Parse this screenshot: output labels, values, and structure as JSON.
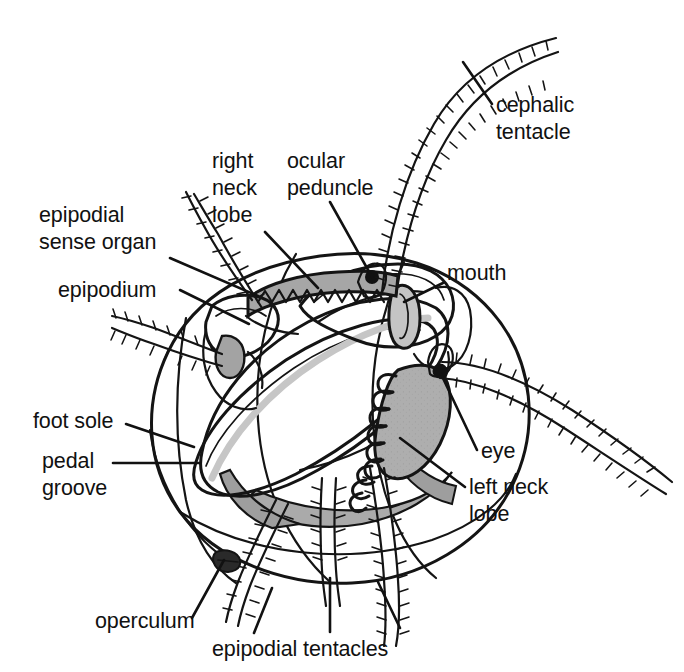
{
  "figure": {
    "view": "right lateral / anterior oblique",
    "background_color": "#ffffff",
    "line_color": "#141414",
    "text_color": "#111111"
  },
  "palette": {
    "shell_fill": "#e3e3e3",
    "body_fill": "#ededed",
    "foot_fill": "#f4f4f4",
    "mantle_shadow": "#bdbdbd",
    "lobe_dark": "#a8a8a8",
    "groove_gray": "#c9c9c9",
    "eye_black": "#111111"
  },
  "labels": [
    {
      "id": "cephalic-tentacle",
      "text_lines": [
        "cephalic",
        "tentacle"
      ],
      "text": "cephalic tentacle",
      "anchor": "start",
      "x": 496,
      "y": 112,
      "line_height": 27,
      "leader": "M 492 104 L 463 62"
    },
    {
      "id": "right-neck-lobe",
      "text_lines": [
        "right",
        "neck",
        "lobe"
      ],
      "text": "right neck lobe",
      "anchor": "start",
      "x": 212,
      "y": 168,
      "line_height": 27,
      "leader": "M 265 232 L 318 288"
    },
    {
      "id": "ocular-peduncle",
      "text_lines": [
        "ocular",
        "peduncle"
      ],
      "text": "ocular peduncle",
      "anchor": "start",
      "x": 287,
      "y": 168,
      "line_height": 27,
      "leader": "M 330 202 L 372 277"
    },
    {
      "id": "epipodial-sense-organ",
      "text_lines": [
        "epipodial",
        "sense organ"
      ],
      "text": "epipodial sense organ",
      "anchor": "start",
      "x": 39,
      "y": 222,
      "line_height": 27,
      "leader": "M 170 258 L 258 296"
    },
    {
      "id": "epipodium",
      "text_lines": [
        "epipodium"
      ],
      "text": "epipodium",
      "anchor": "start",
      "x": 58,
      "y": 297,
      "line_height": 27,
      "leader": "M 180 290 L 249 324"
    },
    {
      "id": "mouth",
      "text_lines": [
        "mouth"
      ],
      "text": "mouth",
      "anchor": "start",
      "x": 447,
      "y": 280,
      "line_height": 27,
      "leader": "M 443 283 L 404 302"
    },
    {
      "id": "foot-sole",
      "text_lines": [
        "foot sole"
      ],
      "text": "foot sole",
      "anchor": "start",
      "x": 33,
      "y": 428,
      "line_height": 27,
      "leader": "M 126 424 L 194 447"
    },
    {
      "id": "pedal-groove",
      "text_lines": [
        "pedal",
        "groove"
      ],
      "text": "pedal groove",
      "anchor": "start",
      "x": 42,
      "y": 468,
      "line_height": 27,
      "leader": "M 113 463 L 200 463"
    },
    {
      "id": "eye",
      "text_lines": [
        "eye"
      ],
      "text": "eye",
      "anchor": "start",
      "x": 481,
      "y": 458,
      "line_height": 27,
      "leader": "M 477 450 L 441 374"
    },
    {
      "id": "left-neck-lobe",
      "text_lines": [
        "left neck",
        "lobe"
      ],
      "text": "left neck lobe",
      "anchor": "start",
      "x": 469,
      "y": 494,
      "line_height": 27,
      "leader": "M 465 487 L 400 438"
    },
    {
      "id": "operculum",
      "text_lines": [
        "operculum"
      ],
      "text": "operculum",
      "anchor": "start",
      "x": 95,
      "y": 628,
      "line_height": 27,
      "leader": "M 192 618 L 224 560"
    },
    {
      "id": "epipodial-tentacles",
      "text_lines": [
        "epipodial tentacles"
      ],
      "text": "epipodial tentacles",
      "anchor": "start",
      "x": 212,
      "y": 656,
      "line_height": 27,
      "leaders": [
        "M 254 633 L 272 588",
        "M 330 632 L 330 578",
        "M 400 628 L 378 582"
      ]
    }
  ],
  "anatomy_parts": [
    "shell",
    "foot",
    "foot sole",
    "pedal groove",
    "head",
    "mouth",
    "cephalic tentacles",
    "ocular peduncles",
    "eyes",
    "right neck lobe",
    "left neck lobe",
    "epipodium",
    "epipodial sense organ",
    "epipodial tentacles",
    "operculum"
  ]
}
